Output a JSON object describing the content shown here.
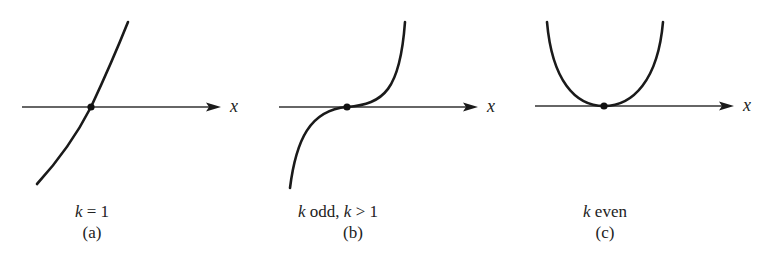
{
  "figure": {
    "panels": [
      {
        "id": "a",
        "axis_label": "x",
        "caption_var": "k",
        "caption_rest": " = 1",
        "sublabel": "(a)",
        "curve": "increasing line through origin (k = 1)"
      },
      {
        "id": "b",
        "axis_label": "x",
        "caption_var": "k",
        "caption_mid": " odd, ",
        "caption_var2": "k",
        "caption_rest": " > 1",
        "sublabel": "(b)",
        "curve": "cubic-like, flat inflection at origin (k odd, k > 1)"
      },
      {
        "id": "c",
        "axis_label": "x",
        "caption_var": "k",
        "caption_rest": " even",
        "sublabel": "(c)",
        "curve": "parabola-like, minimum at origin (k even)"
      }
    ],
    "colors": {
      "stroke": "#1a1a1a",
      "axis": "#333333",
      "background": "#ffffff"
    }
  }
}
